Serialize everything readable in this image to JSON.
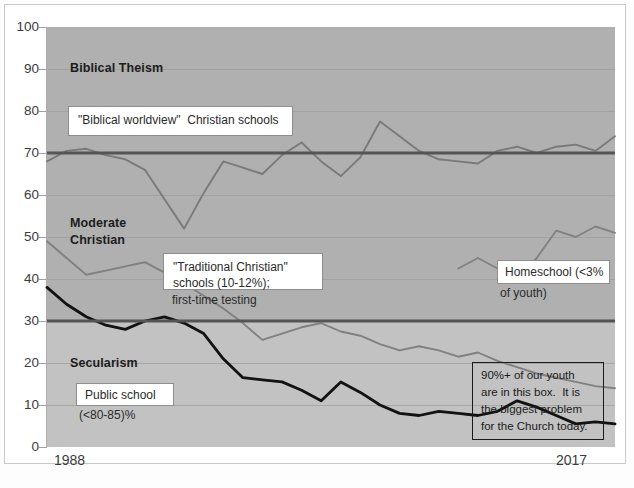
{
  "chart_data": {
    "type": "line",
    "title": "",
    "xlabel": "",
    "ylabel": "",
    "ylim": [
      0,
      100
    ],
    "xlim": [
      1988,
      2017
    ],
    "grid": true,
    "legend_position": "none",
    "y_ticks": [
      100,
      90,
      80,
      70,
      60,
      50,
      40,
      30,
      20,
      10,
      0
    ],
    "x_ticks": [
      "1988",
      "2017"
    ],
    "band_labels": [
      {
        "text": "Biblical Theism",
        "y_value": 92
      },
      {
        "text": "Moderate",
        "y_value": 53
      },
      {
        "text": "Christian",
        "y_value": 47
      },
      {
        "text": "Secularism",
        "y_value": 19
      }
    ],
    "reference_lines": [
      {
        "name": "biblical-theism-threshold",
        "y_value": 70,
        "color": "#555555"
      },
      {
        "name": "secularism-threshold",
        "y_value": 30,
        "color": "#555555"
      }
    ],
    "series": [
      {
        "name": "\"Biblical worldview\" Christian schools",
        "color": "#7a7a7a",
        "x": [
          1988,
          1989,
          1990,
          1991,
          1992,
          1993,
          1994,
          1995,
          1996,
          1997,
          1998,
          1999,
          2000,
          2001,
          2002,
          2003,
          2004,
          2005,
          2006,
          2007,
          2008,
          2009,
          2010,
          2011,
          2012,
          2013,
          2014,
          2015,
          2016,
          2017
        ],
        "values": [
          68,
          70.5,
          71,
          69.5,
          68.5,
          66,
          59,
          52,
          60.5,
          68,
          66.5,
          65,
          69.5,
          72.5,
          68,
          64.5,
          69,
          77.5,
          74,
          70.5,
          68.5,
          68,
          67.5,
          70.5,
          71.5,
          70,
          71.5,
          72,
          70.5,
          74
        ]
      },
      {
        "name": "\"Traditional Christian\" schools (10-12%); first-time testing",
        "color": "#808080",
        "x": [
          1988,
          1989,
          1990,
          1991,
          1992,
          1993,
          1994,
          1995,
          1996,
          1997,
          1998,
          1999,
          2000,
          2001,
          2002,
          2003,
          2004,
          2005,
          2006,
          2007,
          2008,
          2009,
          2010,
          2011,
          2012,
          2013,
          2014,
          2015,
          2016,
          2017
        ],
        "values": [
          49,
          45,
          41,
          42,
          43,
          44,
          41.5,
          39,
          36,
          33,
          29.5,
          25.5,
          27,
          28.5,
          29.5,
          27.5,
          26.5,
          24.5,
          23,
          24,
          23,
          21.5,
          22.5,
          20.5,
          19,
          17.5,
          16.5,
          15.5,
          14.5,
          14
        ]
      },
      {
        "name": "Homeschool (<3% of youth)",
        "color": "#828282",
        "x": [
          2009,
          2010,
          2011,
          2012,
          2013,
          2014,
          2015,
          2016,
          2017
        ],
        "values": [
          42.5,
          45,
          42.5,
          40,
          45,
          51.5,
          50,
          52.5,
          51
        ]
      },
      {
        "name": "Public school (<80-85)%",
        "color": "#121212",
        "x": [
          1988,
          1989,
          1990,
          1991,
          1992,
          1993,
          1994,
          1995,
          1996,
          1997,
          1998,
          1999,
          2000,
          2001,
          2002,
          2003,
          2004,
          2005,
          2006,
          2007,
          2008,
          2009,
          2010,
          2011,
          2012,
          2013,
          2014,
          2015,
          2016,
          2017
        ],
        "values": [
          38,
          34,
          31,
          29,
          28,
          30,
          31,
          29.5,
          27,
          21,
          16.5,
          16,
          15.5,
          13.5,
          11,
          15.5,
          13,
          10,
          8,
          7.5,
          8.5,
          8,
          7.5,
          8.5,
          11,
          9.5,
          7.5,
          5.5,
          6,
          5.5
        ]
      }
    ],
    "annotations": [
      {
        "name": "biblical-worldview-callout",
        "text": "\"Biblical worldview\" Christian schools",
        "boxed": true
      },
      {
        "name": "traditional-christian-callout",
        "text": "\"Traditional Christian\"\nschools (10-12%);",
        "boxed": true
      },
      {
        "name": "first-time-testing-note",
        "text": "first-time testing",
        "boxed": false
      },
      {
        "name": "homeschool-callout",
        "text": "Homeschool (<3%",
        "boxed": true
      },
      {
        "name": "homeschool-note",
        "text": "of youth)",
        "boxed": false
      },
      {
        "name": "public-school-callout",
        "text": "Public school",
        "boxed": true
      },
      {
        "name": "public-school-note",
        "text": "(<80-85)%",
        "boxed": false
      },
      {
        "name": "youth-box-callout",
        "text": "90%+ of our youth\nare in this box.  It is\nthe biggest problem\nfor the Church today.",
        "boxed": true
      }
    ]
  },
  "axis": {
    "y": [
      "100",
      "90",
      "80",
      "70",
      "60",
      "50",
      "40",
      "30",
      "20",
      "10",
      "0"
    ],
    "x_start": "1988",
    "x_end": "2017"
  },
  "labels": {
    "biblical_theism": "Biblical Theism",
    "moderate": "Moderate",
    "christian": "Christian",
    "secularism": "Secularism"
  },
  "callouts": {
    "biblical_worldview": "\"Biblical worldview\"  Christian schools",
    "traditional_line1": "\"Traditional Christian\"",
    "traditional_line2": "schools (10-12%);",
    "first_time_testing": "first-time testing",
    "homeschool_line1": "Homeschool (<3%",
    "homeschool_line2": "of youth)",
    "public_school": "Public school",
    "public_school_pct": "(<80-85)%",
    "youth_box": "90%+ of our youth\nare in this box.  It is\nthe biggest problem\nfor the Church today."
  },
  "colors": {
    "plot_upper_bg": "#b0b0b0",
    "plot_lower_bg": "#c2c2c2",
    "gridline": "#9e9e9e",
    "reference_line": "#555555",
    "gray_series": "#7a7a7a",
    "black_series": "#121212",
    "page_bg": "#ffffff"
  }
}
